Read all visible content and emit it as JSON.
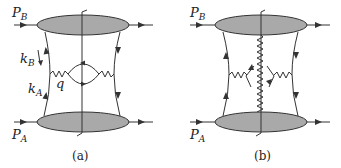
{
  "diagrams": [
    {
      "id": "a",
      "caption": "(a)",
      "labels": {
        "top_momentum": "P",
        "top_momentum_sub": "B",
        "bottom_momentum": "P",
        "bottom_momentum_sub": "A",
        "kB": "k",
        "kB_sub": "B",
        "kA": "k",
        "kA_sub": "A",
        "q": "q"
      }
    },
    {
      "id": "b",
      "caption": "(b)",
      "labels": {
        "top_momentum": "P",
        "top_momentum_sub": "B",
        "bottom_momentum": "P",
        "bottom_momentum_sub": "A"
      }
    }
  ],
  "colors": {
    "blob": "#a9a9a9",
    "line": "#333333"
  }
}
